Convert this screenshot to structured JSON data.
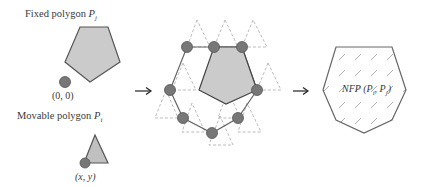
{
  "diagram": {
    "fixed_polygon": {
      "label": "Fixed polygon ",
      "symbol": "P",
      "subscript": "j",
      "origin_label": "(0, 0)"
    },
    "movable_polygon": {
      "label": "Movable polygon ",
      "symbol": "P",
      "subscript": "i",
      "reference_label": "(x, y)"
    },
    "arrows": [
      "→",
      "→"
    ],
    "result": {
      "label_prefix": "NFP (",
      "p1": "P",
      "p1_sub": "i",
      "sep": ", ",
      "p2": "P",
      "p2_sub": "j",
      "label_suffix": ")"
    },
    "colors": {
      "polygon_fill": "#c8c8c8",
      "polygon_stroke": "#555555",
      "dot_fill": "#777777",
      "dashed": "#aaaaaa",
      "hatch": "#999999"
    }
  }
}
